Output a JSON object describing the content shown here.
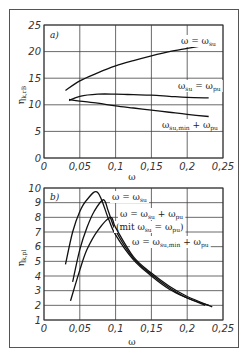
{
  "chart_data": [
    {
      "type": "line",
      "panel_label": "a)",
      "xlabel": "ω",
      "ylabel": "η_k,rB",
      "xlim": [
        0,
        0.25
      ],
      "ylim": [
        0,
        25
      ],
      "x_ticks": [
        "0",
        "0,05",
        "0,1",
        "0,15",
        "0,2",
        "0,25"
      ],
      "y_ticks": [
        "0",
        "5",
        "10",
        "15",
        "20",
        "25"
      ],
      "grid": true,
      "series": [
        {
          "name": "ω = ω_su",
          "x": [
            0.03,
            0.05,
            0.075,
            0.1,
            0.125,
            0.15,
            0.175,
            0.2,
            0.23
          ],
          "values": [
            12.7,
            14.5,
            16.0,
            17.3,
            18.3,
            19.2,
            20.0,
            20.6,
            21.3
          ]
        },
        {
          "name": "ω_su = ω_pu",
          "x": [
            0.035,
            0.05,
            0.075,
            0.1,
            0.125,
            0.15,
            0.175,
            0.2,
            0.23
          ],
          "values": [
            10.8,
            11.6,
            12.0,
            12.0,
            11.9,
            11.8,
            11.6,
            11.4,
            11.3
          ]
        },
        {
          "name": "ω_su,min + ω_pu",
          "x": [
            0.035,
            0.05,
            0.075,
            0.1,
            0.125,
            0.15,
            0.175,
            0.2,
            0.23
          ],
          "values": [
            11.0,
            10.7,
            10.3,
            9.8,
            9.4,
            9.0,
            8.6,
            8.2,
            7.8
          ]
        }
      ]
    },
    {
      "type": "line",
      "panel_label": "b)",
      "xlabel": "ω",
      "ylabel": "η_k,pl",
      "xlim": [
        0,
        0.25
      ],
      "ylim": [
        1,
        10
      ],
      "x_ticks": [
        "0",
        "0,05",
        "0,1",
        "0,15",
        "0,2",
        "0,25"
      ],
      "y_ticks": [
        "1",
        "2",
        "3",
        "4",
        "5",
        "6",
        "7",
        "8",
        "9",
        "10"
      ],
      "grid": true,
      "series": [
        {
          "name": "ω = ω_su",
          "x": [
            0.03,
            0.04,
            0.05,
            0.06,
            0.075,
            0.09,
            0.1,
            0.125,
            0.15,
            0.175,
            0.2,
            0.225
          ],
          "values": [
            4.8,
            7.0,
            8.4,
            9.2,
            9.7,
            7.9,
            6.8,
            5.1,
            4.0,
            3.1,
            2.5,
            2.0
          ]
        },
        {
          "name": "ω = ω_su + ω_pu (mit ω_su = ω_pu)",
          "x": [
            0.04,
            0.05,
            0.06,
            0.07,
            0.083,
            0.09,
            0.1,
            0.125,
            0.15,
            0.175,
            0.2,
            0.23
          ],
          "values": [
            3.6,
            5.8,
            7.3,
            8.4,
            9.2,
            8.4,
            7.1,
            5.2,
            4.1,
            3.2,
            2.5,
            2.0
          ]
        },
        {
          "name": "ω = ω_su,min + ω_pu",
          "x": [
            0.037,
            0.05,
            0.06,
            0.075,
            0.093,
            0.1,
            0.125,
            0.15,
            0.175,
            0.2,
            0.235
          ],
          "values": [
            2.3,
            4.4,
            5.8,
            7.1,
            8.0,
            7.3,
            5.3,
            4.2,
            3.3,
            2.6,
            1.9
          ]
        }
      ]
    }
  ]
}
